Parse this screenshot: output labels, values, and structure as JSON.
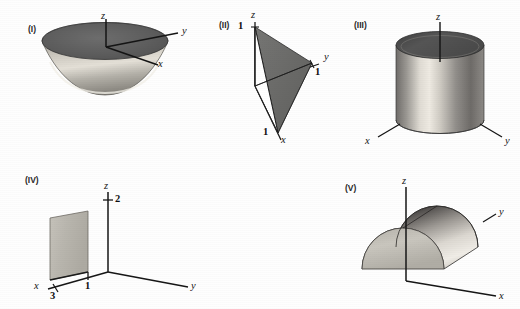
{
  "plate": {
    "background_color": "#fefefe",
    "ink_color": "#151515",
    "figure_count": 5
  },
  "figures": [
    {
      "tag": "(I)",
      "shape": "paraboloid-bowl",
      "description": "Elliptic paraboloid opening upward, shaded bowl with dark top disk",
      "axes": [
        {
          "name": "z-axis-label",
          "text": "z"
        },
        {
          "name": "y-axis-label",
          "text": "y"
        },
        {
          "name": "x-axis-label",
          "text": "x"
        }
      ],
      "ticks": [],
      "colors": {
        "top": "#5e5e5e",
        "shell_light": "#d8d4cb",
        "shell_dark": "#8a8a8a",
        "outline": "#2a2a2a"
      }
    },
    {
      "tag": "(II)",
      "shape": "tetrahedron",
      "description": "Tetrahedron with vertices at 1 on each of the x, y and z axes",
      "axes": [
        {
          "name": "z-axis-label",
          "text": "z"
        },
        {
          "name": "y-axis-label",
          "text": "y"
        },
        {
          "name": "x-axis-label",
          "text": "x"
        }
      ],
      "ticks": [
        {
          "name": "z-tick-one",
          "text": "1"
        },
        {
          "name": "y-tick-one",
          "text": "1"
        },
        {
          "name": "x-tick-one",
          "text": "1"
        }
      ],
      "colors": {
        "face": "#6a6a6a",
        "outline": "#232323"
      }
    },
    {
      "tag": "(III)",
      "shape": "cylinder",
      "description": "Upright circular cylinder centred on the z-axis",
      "axes": [
        {
          "name": "z-axis-label",
          "text": "z"
        },
        {
          "name": "x-axis-label",
          "text": "x"
        },
        {
          "name": "y-axis-label",
          "text": "y"
        }
      ],
      "ticks": [],
      "colors": {
        "top_rim": "#4a4a4a",
        "body_light": "#dedad2",
        "body_dark": "#777471",
        "outline": "#2b2b2b"
      }
    },
    {
      "tag": "(IV)",
      "shape": "vertical-rectangular-plane",
      "description": "Flat vertical rectangle rising from the line through x = 3 and y-intercept 1, up to height 2",
      "axes": [
        {
          "name": "z-axis-label",
          "text": "z"
        },
        {
          "name": "x-axis-label",
          "text": "x"
        },
        {
          "name": "y-axis-label",
          "text": "y"
        }
      ],
      "ticks": [
        {
          "name": "z-tick-two",
          "text": "2"
        },
        {
          "name": "y-tick-one",
          "text": "1"
        },
        {
          "name": "x-tick-three",
          "text": "3"
        }
      ],
      "colors": {
        "face": "#b9b6ae",
        "outline": "#3a3a3a"
      }
    },
    {
      "tag": "(V)",
      "shape": "half-cylinder",
      "description": "Half cylinder lying along the y-axis with flat face on the xy-plane",
      "axes": [
        {
          "name": "z-axis-label",
          "text": "z"
        },
        {
          "name": "y-axis-label",
          "text": "y"
        },
        {
          "name": "x-axis-label",
          "text": "x"
        }
      ],
      "ticks": [],
      "colors": {
        "cap_light": "#c9c6be",
        "barrel_dark": "#3e3c3a",
        "barrel_light": "#efece6",
        "outline": "#2b2b2b"
      }
    }
  ],
  "labels": {
    "fig1": {
      "tag": "(I)",
      "z": "z",
      "y": "y",
      "x": "x"
    },
    "fig2": {
      "tag": "(II)",
      "z": "z",
      "y": "y",
      "x": "x",
      "z1": "1",
      "y1": "1",
      "x1": "1"
    },
    "fig3": {
      "tag": "(III)",
      "z": "z",
      "x": "x",
      "y": "y"
    },
    "fig4": {
      "tag": "(IV)",
      "z": "z",
      "x": "x",
      "y": "y",
      "z2": "2",
      "y1": "1",
      "x3": "3"
    },
    "fig5": {
      "tag": "(V)",
      "z": "z",
      "y": "y",
      "x": "x"
    }
  }
}
